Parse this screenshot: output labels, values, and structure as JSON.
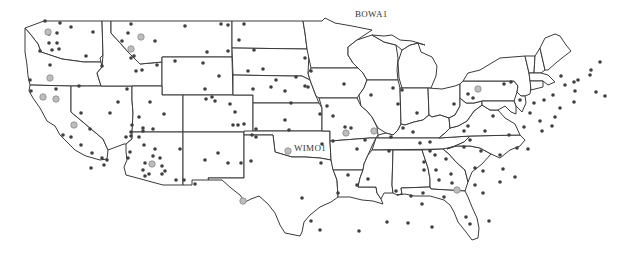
{
  "map": {
    "title": "",
    "labels": [
      {
        "id": "bowa1",
        "text": "BOWA1",
        "x": 355,
        "y": 9
      },
      {
        "id": "wimo1",
        "text": "WIMO1",
        "x": 293,
        "y": 143
      }
    ],
    "colors": {
      "background": "#ffffff",
      "boundary": "#3a3a3a",
      "site_dark": "#3f3f3f",
      "site_light": "#bdbdbd"
    },
    "legend": null,
    "sites_dark": [
      [
        45,
        21
      ],
      [
        60,
        23
      ],
      [
        71,
        27
      ],
      [
        93,
        32
      ],
      [
        49,
        34
      ],
      [
        57,
        33
      ],
      [
        49,
        43
      ],
      [
        57,
        43
      ],
      [
        52,
        50
      ],
      [
        40,
        51
      ],
      [
        59,
        49
      ],
      [
        86,
        56
      ],
      [
        50,
        65
      ],
      [
        30,
        80
      ],
      [
        56,
        89
      ],
      [
        31,
        91
      ],
      [
        131,
        24
      ],
      [
        128,
        33
      ],
      [
        155,
        41
      ],
      [
        122,
        41
      ],
      [
        134,
        56
      ],
      [
        131,
        58
      ],
      [
        102,
        66
      ],
      [
        136,
        71
      ],
      [
        142,
        70
      ],
      [
        157,
        65
      ],
      [
        185,
        26
      ],
      [
        221,
        24
      ],
      [
        228,
        25
      ],
      [
        244,
        24
      ],
      [
        239,
        40
      ],
      [
        207,
        52
      ],
      [
        228,
        51
      ],
      [
        254,
        50
      ],
      [
        175,
        61
      ],
      [
        203,
        63
      ],
      [
        219,
        76
      ],
      [
        248,
        71
      ],
      [
        263,
        69
      ],
      [
        311,
        71
      ],
      [
        305,
        58
      ],
      [
        305,
        86
      ],
      [
        253,
        89
      ],
      [
        271,
        87
      ],
      [
        276,
        80
      ],
      [
        212,
        97
      ],
      [
        206,
        99
      ],
      [
        205,
        89
      ],
      [
        215,
        101
      ],
      [
        150,
        102
      ],
      [
        127,
        89
      ],
      [
        118,
        102
      ],
      [
        79,
        86
      ],
      [
        81,
        113
      ],
      [
        110,
        113
      ],
      [
        139,
        117
      ],
      [
        164,
        114
      ],
      [
        235,
        112
      ],
      [
        233,
        125
      ],
      [
        230,
        104
      ],
      [
        63,
        135
      ],
      [
        71,
        137
      ],
      [
        90,
        129
      ],
      [
        81,
        145
      ],
      [
        92,
        153
      ],
      [
        91,
        168
      ],
      [
        102,
        158
      ],
      [
        107,
        160
      ],
      [
        104,
        165
      ],
      [
        132,
        125
      ],
      [
        131,
        132
      ],
      [
        143,
        128
      ],
      [
        153,
        129
      ],
      [
        126,
        137
      ],
      [
        131,
        136
      ],
      [
        139,
        137
      ],
      [
        143,
        131
      ],
      [
        144,
        145
      ],
      [
        130,
        152
      ],
      [
        128,
        158
      ],
      [
        155,
        149
      ],
      [
        160,
        158
      ],
      [
        162,
        166
      ],
      [
        162,
        174
      ],
      [
        176,
        180
      ],
      [
        165,
        171
      ],
      [
        180,
        149
      ],
      [
        153,
        156
      ],
      [
        143,
        170
      ],
      [
        145,
        176
      ],
      [
        149,
        174
      ],
      [
        145,
        163
      ],
      [
        184,
        180
      ],
      [
        195,
        184
      ],
      [
        205,
        160
      ],
      [
        218,
        153
      ],
      [
        228,
        163
      ],
      [
        241,
        163
      ],
      [
        251,
        161
      ],
      [
        244,
        124
      ],
      [
        238,
        125
      ],
      [
        252,
        135
      ],
      [
        256,
        129
      ],
      [
        285,
        91
      ],
      [
        308,
        87
      ],
      [
        296,
        77
      ],
      [
        291,
        103
      ],
      [
        256,
        137
      ],
      [
        320,
        114
      ],
      [
        285,
        120
      ],
      [
        289,
        130
      ],
      [
        322,
        144
      ],
      [
        333,
        141
      ],
      [
        333,
        116
      ],
      [
        327,
        106
      ],
      [
        344,
        84
      ],
      [
        371,
        95
      ],
      [
        345,
        127
      ],
      [
        351,
        128
      ],
      [
        357,
        149
      ],
      [
        321,
        163
      ],
      [
        338,
        193
      ],
      [
        302,
        198
      ],
      [
        311,
        221
      ],
      [
        320,
        230
      ],
      [
        348,
        175
      ],
      [
        357,
        185
      ],
      [
        365,
        140
      ],
      [
        368,
        179
      ],
      [
        393,
        88
      ],
      [
        402,
        90
      ],
      [
        398,
        104
      ],
      [
        391,
        137
      ],
      [
        403,
        128
      ],
      [
        420,
        143
      ],
      [
        417,
        113
      ],
      [
        413,
        132
      ],
      [
        389,
        151
      ],
      [
        435,
        155
      ],
      [
        424,
        170
      ],
      [
        436,
        170
      ],
      [
        446,
        159
      ],
      [
        430,
        151
      ],
      [
        424,
        162
      ],
      [
        464,
        131
      ],
      [
        468,
        126
      ],
      [
        470,
        140
      ],
      [
        485,
        131
      ],
      [
        454,
        104
      ],
      [
        464,
        147
      ],
      [
        481,
        151
      ],
      [
        500,
        155
      ],
      [
        503,
        169
      ],
      [
        483,
        171
      ],
      [
        451,
        174
      ],
      [
        452,
        183
      ],
      [
        430,
        142
      ],
      [
        439,
        180
      ],
      [
        475,
        185
      ],
      [
        493,
        116
      ],
      [
        509,
        135
      ],
      [
        473,
        98
      ],
      [
        468,
        94
      ],
      [
        504,
        84
      ],
      [
        511,
        82
      ],
      [
        520,
        100
      ],
      [
        530,
        113
      ],
      [
        534,
        103
      ],
      [
        544,
        100
      ],
      [
        553,
        95
      ],
      [
        560,
        108
      ],
      [
        561,
        76
      ],
      [
        565,
        85
      ],
      [
        574,
        82
      ],
      [
        575,
        91
      ],
      [
        578,
        80
      ],
      [
        590,
        75
      ],
      [
        600,
        62
      ],
      [
        591,
        70
      ],
      [
        596,
        92
      ],
      [
        605,
        96
      ],
      [
        574,
        102
      ],
      [
        524,
        127
      ],
      [
        540,
        121
      ],
      [
        528,
        149
      ],
      [
        517,
        148
      ],
      [
        542,
        131
      ],
      [
        552,
        126
      ],
      [
        555,
        117
      ],
      [
        396,
        191
      ],
      [
        411,
        196
      ],
      [
        422,
        204
      ],
      [
        423,
        193
      ],
      [
        444,
        197
      ],
      [
        483,
        193
      ],
      [
        500,
        182
      ],
      [
        515,
        177
      ],
      [
        475,
        168
      ],
      [
        466,
        217
      ],
      [
        470,
        224
      ],
      [
        489,
        221
      ],
      [
        432,
        227
      ],
      [
        387,
        222
      ],
      [
        408,
        223
      ],
      [
        359,
        231
      ]
    ],
    "sites_light": [
      [
        48,
        32
      ],
      [
        141,
        37
      ],
      [
        50,
        78
      ],
      [
        43,
        97
      ],
      [
        56,
        99
      ],
      [
        131,
        49
      ],
      [
        74,
        125
      ],
      [
        152,
        164
      ],
      [
        243,
        201
      ],
      [
        288,
        151
      ],
      [
        346,
        133
      ],
      [
        374,
        131
      ],
      [
        478,
        89
      ],
      [
        457,
        190
      ]
    ]
  }
}
